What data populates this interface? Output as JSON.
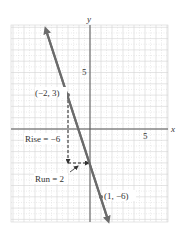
{
  "figure": {
    "axis_labels": {
      "x": "x",
      "y": "y"
    },
    "ticks": {
      "x_five": "5",
      "y_five": "5"
    },
    "points": [
      {
        "label": "(−2, 3)",
        "x": -2,
        "y": 3
      },
      {
        "label": "(1, −6)",
        "x": 1,
        "y": -6
      }
    ],
    "annotations": {
      "rise": "Rise = −6",
      "run": "Run = 2"
    },
    "colors": {
      "line": "#6b6b6b",
      "grid": "#cfcfcf",
      "axis": "#555555",
      "text": "#333333"
    }
  },
  "chart_data": {
    "type": "line",
    "title": "",
    "xlabel": "x",
    "ylabel": "y",
    "xlim": [
      -7,
      7
    ],
    "ylim": [
      -8,
      9
    ],
    "grid": true,
    "series": [
      {
        "name": "line through (-2,3) and (1,-6)",
        "x": [
          -2,
          1
        ],
        "y": [
          3,
          -6
        ],
        "slope": -3
      }
    ],
    "annotations": [
      "(−2, 3)",
      "(1, −6)",
      "Rise = −6",
      "Run = 2"
    ],
    "tick_labels": {
      "x": [
        "5"
      ],
      "y": [
        "5"
      ]
    }
  }
}
